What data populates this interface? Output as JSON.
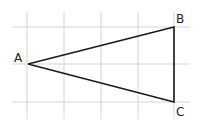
{
  "diagram": {
    "type": "triangle-on-grid",
    "grid": {
      "vertical_x": [
        27,
        64,
        101,
        138,
        174
      ],
      "horizontal_y": [
        27,
        64,
        102
      ],
      "x_extent": [
        12,
        190
      ],
      "y_extent": [
        12,
        119
      ],
      "color": "#d4d4d4"
    },
    "vertices": [
      {
        "label": "A",
        "x": 28,
        "y": 64,
        "label_x": 14,
        "label_y": 62
      },
      {
        "label": "B",
        "x": 174,
        "y": 27,
        "label_x": 176,
        "label_y": 23
      },
      {
        "label": "C",
        "x": 174,
        "y": 102,
        "label_x": 176,
        "label_y": 116
      }
    ],
    "line_color": "#1a1a1a"
  }
}
